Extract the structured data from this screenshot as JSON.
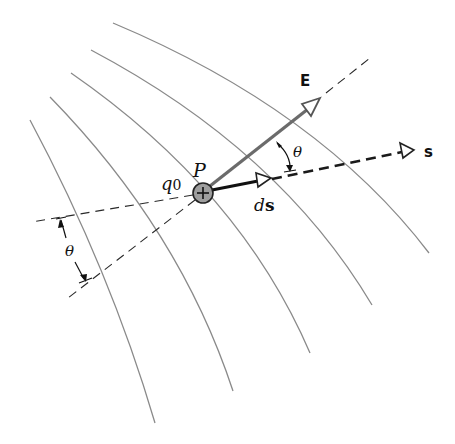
{
  "diagram": {
    "labels": {
      "point": "P",
      "charge": "q",
      "charge_subscript": "0",
      "charge_sign": "+",
      "field_vector": "E",
      "displacement_prefix": "d",
      "displacement_vector": "s",
      "path": "s",
      "angle_top": "θ",
      "angle_left": "θ"
    },
    "field_lines": {
      "count": 5,
      "color": "#8a8a8a"
    },
    "colors": {
      "field_vector": "#6b6b6b",
      "charge_fill": "#9e9e9e",
      "ink": "#111111",
      "background": "#ffffff"
    }
  }
}
